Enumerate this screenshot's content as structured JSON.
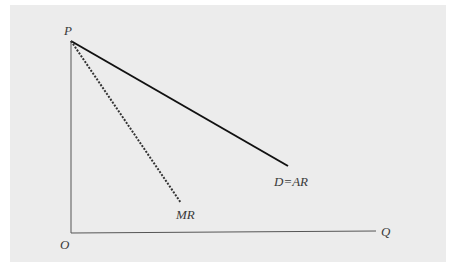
{
  "diagram": {
    "type": "monopoly demand and marginal revenue",
    "labels": {
      "price_axis": "P",
      "origin": "O",
      "quantity_axis": "Q",
      "demand_curve": "D=AR",
      "marginal_revenue_curve": "MR"
    },
    "colors": {
      "panel_background": "#ececec",
      "demand_line": "#111111",
      "mr_line": "#333333",
      "axis_line": "#555555",
      "label_text": "#3a3a3a"
    },
    "geometry": {
      "origin": [
        71,
        233
      ],
      "price_intercept": [
        71,
        41
      ],
      "quantity_axis_end": [
        376,
        231
      ],
      "demand_end": [
        288,
        166
      ],
      "mr_end": [
        181,
        203
      ]
    }
  }
}
